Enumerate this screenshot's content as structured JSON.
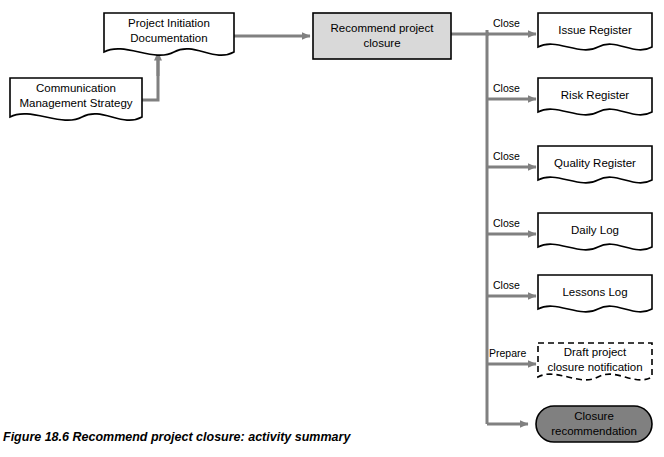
{
  "figure": {
    "caption": "Figure 18.6  Recommend project closure: activity summary"
  },
  "nodes": {
    "pid": {
      "label": "Project Initiation\nDocumentation",
      "type": "document"
    },
    "comms": {
      "label": "Communication\nManagement Strategy",
      "type": "document"
    },
    "activity": {
      "label": "Recommend project\nclosure",
      "type": "process"
    },
    "issue_register": {
      "label": "Issue Register",
      "type": "document"
    },
    "risk_register": {
      "label": "Risk Register",
      "type": "document"
    },
    "quality_register": {
      "label": "Quality Register",
      "type": "document"
    },
    "daily_log": {
      "label": "Daily Log",
      "type": "document"
    },
    "lessons_log": {
      "label": "Lessons  Log",
      "type": "document"
    },
    "draft_notification": {
      "label": "Draft project\nclosure notification",
      "type": "document-dashed"
    },
    "closure_recommendation": {
      "label": "Closure\nrecommendation",
      "type": "rounded-filled"
    }
  },
  "edge_labels": {
    "close_issue": "Close",
    "close_risk": "Close",
    "close_quality": "Close",
    "close_daily": "Close",
    "close_lessons": "Close",
    "prepare_draft": "Prepare"
  },
  "colors": {
    "line": "#808080",
    "node_stroke": "#000000",
    "activity_fill": "#d9d9d9",
    "closure_fill": "#808080",
    "page_background": "#ffffff"
  }
}
